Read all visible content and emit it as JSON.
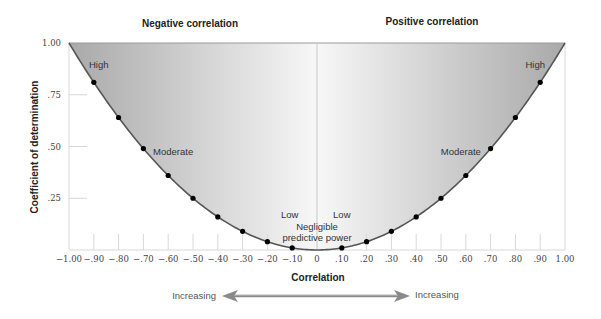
{
  "chart_data": {
    "type": "line",
    "title": "",
    "section_titles": [
      "Negative correlation",
      "Positive correlation"
    ],
    "xlabel": "Correlation",
    "ylabel": "Coefficient of determination",
    "xlim": [
      -1.0,
      1.0
    ],
    "ylim": [
      0,
      1.0
    ],
    "x_ticks": [
      -1.0,
      -0.9,
      -0.8,
      -0.7,
      -0.6,
      -0.5,
      -0.4,
      -0.3,
      -0.2,
      -0.1,
      0,
      0.1,
      0.2,
      0.3,
      0.4,
      0.5,
      0.6,
      0.7,
      0.8,
      0.9,
      1.0
    ],
    "x_tick_labels": [
      "−1.00",
      "−.90",
      "−.80",
      "−.70",
      "−.60",
      "−.50",
      "−.40",
      "−.30",
      "−.20",
      "−.10",
      "0",
      ".10",
      ".20",
      ".30",
      ".40",
      ".50",
      ".60",
      ".70",
      ".80",
      ".90",
      "1.00"
    ],
    "y_ticks": [
      0.25,
      0.5,
      0.75,
      1.0
    ],
    "y_tick_labels": [
      ".25",
      ".50",
      ".75",
      "1.00"
    ],
    "grid": false,
    "series": [
      {
        "name": "Coefficient of determination (r squared)",
        "x": [
          -0.9,
          -0.8,
          -0.7,
          -0.6,
          -0.5,
          -0.4,
          -0.3,
          -0.2,
          -0.1,
          0.1,
          0.2,
          0.3,
          0.4,
          0.5,
          0.6,
          0.7,
          0.8,
          0.9
        ],
        "y": [
          0.81,
          0.64,
          0.49,
          0.36,
          0.25,
          0.16,
          0.09,
          0.04,
          0.01,
          0.01,
          0.04,
          0.09,
          0.16,
          0.25,
          0.36,
          0.49,
          0.64,
          0.81
        ]
      }
    ],
    "annotations": [
      {
        "text": "High",
        "x": -0.88,
        "y": 0.88
      },
      {
        "text": "Moderate",
        "x": -0.58,
        "y": 0.46
      },
      {
        "text": "Low",
        "x": -0.11,
        "y": 0.155
      },
      {
        "text": "Low",
        "x": 0.1,
        "y": 0.155
      },
      {
        "text": "Negligible",
        "x": 0.0,
        "y": 0.095
      },
      {
        "text": "predictive power",
        "x": 0.0,
        "y": 0.045
      },
      {
        "text": "Moderate",
        "x": 0.58,
        "y": 0.46
      },
      {
        "text": "High",
        "x": 0.88,
        "y": 0.88
      }
    ],
    "direction_labels": {
      "left": "Increasing",
      "right": "Increasing"
    },
    "colors": {
      "curve": "#555555",
      "fill_edge": "#a9a9a9",
      "fill_center": "#f7f7f7",
      "points": "#000000",
      "axis": "#d8d8d8"
    }
  }
}
